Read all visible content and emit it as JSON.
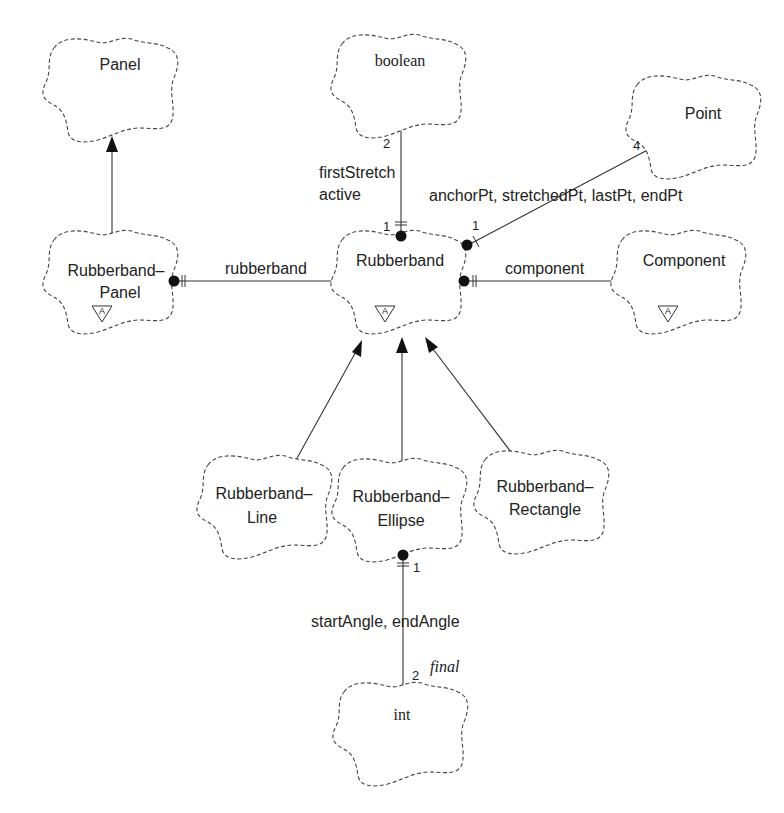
{
  "diagram": {
    "type": "Booch class diagram",
    "classes": {
      "panel": {
        "name": "Panel",
        "font": "sans"
      },
      "boolean": {
        "name": "boolean",
        "font": "serif"
      },
      "point": {
        "name": "Point",
        "font": "sans"
      },
      "rubberband_panel": {
        "line1": "Rubberband–",
        "line2": "Panel",
        "abstract": true,
        "adornment": "A"
      },
      "rubberband": {
        "name": "Rubberband",
        "abstract": true,
        "adornment": "A"
      },
      "component": {
        "name": "Component",
        "abstract": true,
        "adornment": "A"
      },
      "rubberband_line": {
        "line1": "Rubberband–",
        "line2": "Line"
      },
      "rubberband_ellipse": {
        "line1": "Rubberband–",
        "line2": "Ellipse"
      },
      "rubberband_rectangle": {
        "line1": "Rubberband–",
        "line2": "Rectangle"
      },
      "int": {
        "name": "int",
        "font": "serif"
      }
    },
    "relationships": {
      "boolean_rel": {
        "from": "Rubberband",
        "to": "boolean",
        "kind": "has",
        "role_line1": "firstStretch",
        "role_line2": "active",
        "mult_source": "1",
        "mult_target": "2"
      },
      "point_rel": {
        "from": "Rubberband",
        "to": "Point",
        "kind": "has",
        "role": "anchorPt, stretchedPt, lastPt, endPt",
        "mult_source": "1",
        "mult_target": "4"
      },
      "rubberband_rel": {
        "from": "Rubberband–Panel",
        "to": "Rubberband",
        "kind": "has",
        "role": "rubberband"
      },
      "component_rel": {
        "from": "Rubberband",
        "to": "Component",
        "kind": "has",
        "role": "component"
      },
      "angle_rel": {
        "from": "Rubberband–Ellipse",
        "to": "int",
        "kind": "has",
        "role": "startAngle, endAngle",
        "mult_source": "1",
        "mult_target": "2",
        "qualifier": "final"
      },
      "inheritance": [
        {
          "child": "Rubberband–Panel",
          "parent": "Panel"
        },
        {
          "child": "Rubberband–Line",
          "parent": "Rubberband"
        },
        {
          "child": "Rubberband–Ellipse",
          "parent": "Rubberband"
        },
        {
          "child": "Rubberband–Rectangle",
          "parent": "Rubberband"
        }
      ]
    }
  }
}
